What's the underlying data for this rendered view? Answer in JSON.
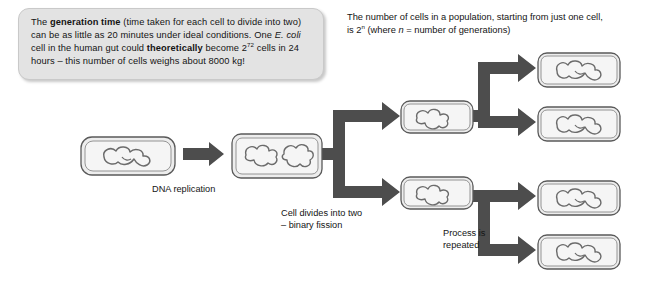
{
  "diagram": {
    "colors": {
      "callout_bg": "#e3e3e3",
      "callout_border": "#c9c9c9",
      "arrow_fill": "#4d4d4d",
      "cell_outline": "#5a5a5a",
      "cell_fill": "#ededed",
      "dna_stroke": "#6b6b6b",
      "page_bg": "#ffffff",
      "text": "#141414"
    },
    "callout": {
      "line1_pre": "The ",
      "line1_bold": "generation time",
      "line1_post": " (time taken for each cell to divide into two)",
      "line2_pre": "can be as little as 20 minutes under ideal conditions. One ",
      "line2_italic": "E. coli",
      "line3_pre": "cell in the human gut could ",
      "line3_bold": "theoretically",
      "line3_mid": " become 2",
      "line3_sup": "72",
      "line3_post": " cells in",
      "line4": "24 hours – this number of cells weighs about 8000 kg!"
    },
    "note": {
      "line1": "The number of cells in a population, starting from just one cell,",
      "line2_pre": "is 2",
      "line2_sup": "n",
      "line2_mid": " (where ",
      "line2_italic": "n",
      "line2_post": " = number of generations)"
    },
    "captions": {
      "dna_replication": "DNA replication",
      "cell_divides": "Cell divides into two\n– binary fission",
      "process_repeated": "Process is\nrepeated"
    },
    "cells": [
      {
        "id": "parent-cell",
        "label": "parent bacterial cell",
        "dna_loops": 1
      },
      {
        "id": "replicated-cell",
        "label": "cell after DNA replication",
        "dna_loops": 2
      },
      {
        "id": "daughter-cell-top",
        "label": "daughter cell generation 1 top",
        "dna_loops": 1
      },
      {
        "id": "daughter-cell-bottom",
        "label": "daughter cell generation 1 bottom",
        "dna_loops": 1
      },
      {
        "id": "granddaughter-cell-1",
        "label": "generation 2 cell 1",
        "dna_loops": 1
      },
      {
        "id": "granddaughter-cell-2",
        "label": "generation 2 cell 2",
        "dna_loops": 1
      },
      {
        "id": "granddaughter-cell-3",
        "label": "generation 2 cell 3",
        "dna_loops": 1
      },
      {
        "id": "granddaughter-cell-4",
        "label": "generation 2 cell 4",
        "dna_loops": 1
      }
    ],
    "arrows": [
      {
        "id": "arrow-dna-replication",
        "label": "parent to replicated cell"
      },
      {
        "id": "arrow-to-fork",
        "label": "replicated cell to division fork"
      },
      {
        "id": "arrow-fork-generation1",
        "label": "fork into two daughter cells"
      },
      {
        "id": "arrow-fork-top-gen2",
        "label": "top daughter cell into two"
      },
      {
        "id": "arrow-fork-bottom-gen2",
        "label": "bottom daughter cell into two"
      }
    ]
  }
}
